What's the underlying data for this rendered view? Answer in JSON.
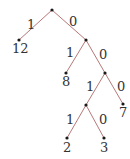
{
  "diagram": {
    "type": "binary-tree",
    "edge_color": "#b87878",
    "node_color": "#1a1a1a",
    "nodes": [
      {
        "id": "root",
        "x": 52,
        "y": 10,
        "label": ""
      },
      {
        "id": "leaf12",
        "x": 19,
        "y": 40,
        "label": "12"
      },
      {
        "id": "n1",
        "x": 86,
        "y": 40,
        "label": ""
      },
      {
        "id": "leaf8",
        "x": 66,
        "y": 73,
        "label": "8"
      },
      {
        "id": "n2",
        "x": 105,
        "y": 73,
        "label": ""
      },
      {
        "id": "n3",
        "x": 86,
        "y": 105,
        "label": ""
      },
      {
        "id": "leaf7",
        "x": 123,
        "y": 104,
        "label": "7"
      },
      {
        "id": "leaf2",
        "x": 67,
        "y": 138,
        "label": "2"
      },
      {
        "id": "leaf3",
        "x": 104,
        "y": 138,
        "label": "3"
      }
    ],
    "edges": [
      {
        "from": "root",
        "to": "leaf12",
        "label": "1"
      },
      {
        "from": "root",
        "to": "n1",
        "label": "0"
      },
      {
        "from": "n1",
        "to": "leaf8",
        "label": "1"
      },
      {
        "from": "n1",
        "to": "n2",
        "label": "0"
      },
      {
        "from": "n2",
        "to": "n3",
        "label": "1"
      },
      {
        "from": "n2",
        "to": "leaf7",
        "label": "0"
      },
      {
        "from": "n3",
        "to": "leaf2",
        "label": "1"
      },
      {
        "from": "n3",
        "to": "leaf3",
        "label": "0"
      }
    ]
  }
}
